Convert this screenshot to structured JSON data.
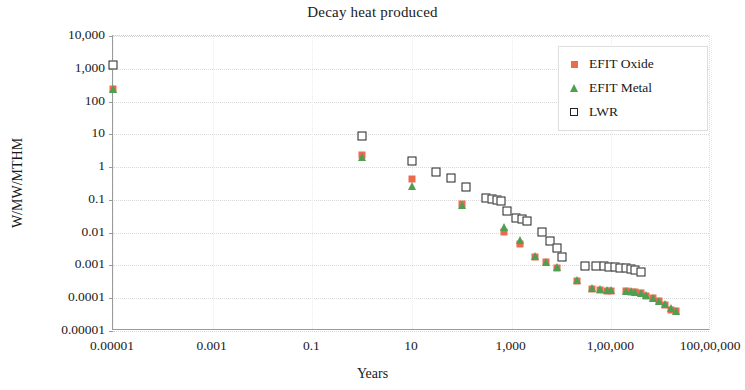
{
  "chart_data": {
    "type": "scatter",
    "title": "Decay heat produced",
    "xlabel": "Years",
    "ylabel": "W/MW/MTHM",
    "xscale": "log",
    "yscale": "log",
    "xlim": [
      1e-05,
      10000000
    ],
    "ylim": [
      1e-05,
      10000
    ],
    "grid": true,
    "legend_position": "top-right",
    "x_tick_labels": [
      "0.00001",
      "0.001",
      "0.1",
      "10",
      "1,000",
      "1,00,000",
      "100,00,000"
    ],
    "x_tick_values": [
      1e-05,
      0.001,
      0.1,
      10,
      1000,
      100000,
      10000000
    ],
    "y_tick_labels": [
      "10,000",
      "1,000",
      "100",
      "10",
      "1",
      "0.1",
      "0.01",
      "0.001",
      "0.0001",
      "0.00001"
    ],
    "y_tick_values": [
      10000,
      1000,
      100,
      10,
      1,
      0.1,
      0.01,
      0.001,
      0.0001,
      1e-05
    ],
    "series": [
      {
        "name": "EFIT Oxide",
        "marker": "square",
        "color": "#ec6b4e",
        "points": [
          [
            1e-05,
            250
          ],
          [
            1.0,
            2.3
          ],
          [
            10,
            0.42
          ],
          [
            100,
            0.075
          ],
          [
            700,
            0.0105
          ],
          [
            1500,
            0.0046
          ],
          [
            3000,
            0.0018
          ],
          [
            5000,
            0.00125
          ],
          [
            8000,
            0.00085
          ],
          [
            20000,
            0.00034
          ],
          [
            40000,
            0.00019
          ],
          [
            60000,
            0.000175
          ],
          [
            80000,
            0.000172
          ],
          [
            100000,
            0.00017
          ],
          [
            200000,
            0.000165
          ],
          [
            250000,
            0.00016
          ],
          [
            300000,
            0.000155
          ],
          [
            400000,
            0.00014
          ],
          [
            500000,
            0.00012
          ],
          [
            700000,
            0.0001
          ],
          [
            900000,
            8e-05
          ],
          [
            1200000,
            6e-05
          ],
          [
            1600000,
            4.5e-05
          ],
          [
            2000000,
            4e-05
          ]
        ]
      },
      {
        "name": "EFIT Metal",
        "marker": "triangle",
        "color": "#4f9e52",
        "points": [
          [
            1e-05,
            240
          ],
          [
            1.0,
            2.1
          ],
          [
            10,
            0.27
          ],
          [
            100,
            0.07
          ],
          [
            700,
            0.0145
          ],
          [
            1500,
            0.0058
          ],
          [
            3000,
            0.0019
          ],
          [
            5000,
            0.0013
          ],
          [
            8000,
            0.0009
          ],
          [
            20000,
            0.00035
          ],
          [
            40000,
            0.0002
          ],
          [
            60000,
            0.000185
          ],
          [
            80000,
            0.00018
          ],
          [
            100000,
            0.000178
          ],
          [
            200000,
            0.000172
          ],
          [
            250000,
            0.000168
          ],
          [
            300000,
            0.00016
          ],
          [
            400000,
            0.000145
          ],
          [
            500000,
            0.000125
          ],
          [
            700000,
            0.000105
          ],
          [
            900000,
            8.5e-05
          ],
          [
            1200000,
            6.5e-05
          ],
          [
            1600000,
            5e-05
          ],
          [
            2000000,
            4.2e-05
          ]
        ]
      },
      {
        "name": "LWR",
        "marker": "open-square",
        "color": "#222222",
        "points": [
          [
            1e-05,
            1300
          ],
          [
            1.0,
            9.0
          ],
          [
            10,
            1.55
          ],
          [
            30,
            0.72
          ],
          [
            60,
            0.46
          ],
          [
            120,
            0.25
          ],
          [
            300,
            0.115
          ],
          [
            400,
            0.105
          ],
          [
            500,
            0.098
          ],
          [
            600,
            0.09
          ],
          [
            800,
            0.045
          ],
          [
            1200,
            0.029
          ],
          [
            1600,
            0.026
          ],
          [
            2000,
            0.022
          ],
          [
            4000,
            0.0105
          ],
          [
            6000,
            0.0055
          ],
          [
            8000,
            0.0035
          ],
          [
            10000,
            0.0018
          ],
          [
            30000,
            0.00098
          ],
          [
            50000,
            0.00096
          ],
          [
            70000,
            0.00094
          ],
          [
            90000,
            0.0009
          ],
          [
            120000,
            0.00088
          ],
          [
            150000,
            0.00086
          ],
          [
            200000,
            0.00082
          ],
          [
            250000,
            0.00078
          ],
          [
            300000,
            0.00072
          ],
          [
            400000,
            0.00065
          ]
        ]
      }
    ]
  }
}
